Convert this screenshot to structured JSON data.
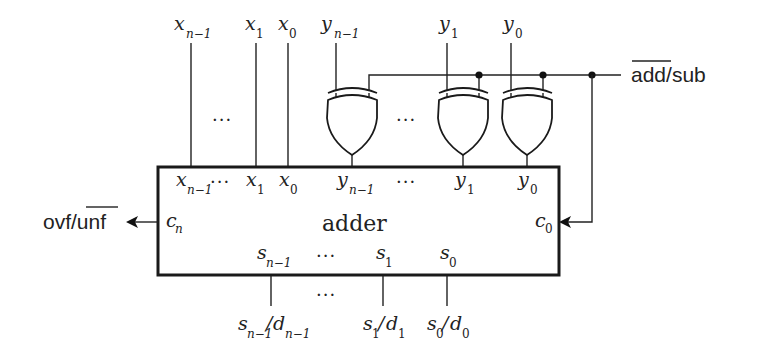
{
  "diagram": {
    "title": "adder",
    "colors": {
      "line": "#222222",
      "background": "#ffffff"
    },
    "top_inputs": {
      "x": [
        {
          "base": "x",
          "sub": "n−1",
          "sub_italic_prefix": "n",
          "x": 190
        },
        {
          "base": "x",
          "sub": "1",
          "x": 255
        },
        {
          "base": "x",
          "sub": "0",
          "x": 288
        }
      ],
      "y": [
        {
          "base": "y",
          "sub": "n−1",
          "x": 336
        },
        {
          "base": "y",
          "sub": "1",
          "x": 447
        },
        {
          "base": "y",
          "sub": "0",
          "x": 511
        }
      ],
      "ellipsis_x": "···",
      "ellipsis_y": "···"
    },
    "xor_gates": [
      {
        "name": "xor-gate-n-1",
        "input_y": "y_{n-1}"
      },
      {
        "name": "xor-gate-1",
        "input_y": "y_1"
      },
      {
        "name": "xor-gate-0",
        "input_y": "y_0"
      }
    ],
    "control_signal": {
      "overline": "add",
      "rest": "/sub",
      "full": "add/sub (add overlined)"
    },
    "adder_ports": {
      "x_inputs": [
        {
          "base": "x",
          "sub": "n−1"
        },
        {
          "base": "x",
          "sub": "1"
        },
        {
          "base": "x",
          "sub": "0"
        }
      ],
      "y_inputs": [
        {
          "base": "y",
          "sub": "n−1"
        },
        {
          "base": "y",
          "sub": "1"
        },
        {
          "base": "y",
          "sub": "0"
        }
      ],
      "carry_out": {
        "base": "c",
        "sub": "n"
      },
      "carry_in": {
        "base": "c",
        "sub": "0"
      },
      "sum_outputs": [
        {
          "base": "s",
          "sub": "n−1"
        },
        {
          "base": "s",
          "sub": "1"
        },
        {
          "base": "s",
          "sub": "0"
        }
      ],
      "ellipsis": "···"
    },
    "overflow_output": {
      "plain": "ovf/",
      "overline": "unf"
    },
    "bottom_outputs": [
      {
        "s": "s",
        "s_sub": "n−1",
        "d": "d",
        "d_sub": "n−1"
      },
      {
        "s": "s",
        "s_sub": "1",
        "d": "d",
        "d_sub": "1"
      },
      {
        "s": "s",
        "s_sub": "0",
        "d": "d",
        "d_sub": "0"
      }
    ],
    "bottom_ellipsis": "···",
    "slash": "/"
  }
}
